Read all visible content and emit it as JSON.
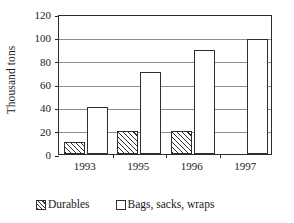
{
  "chart_data": {
    "type": "bar",
    "title": "",
    "xlabel": "",
    "ylabel": "Thousand tons",
    "categories": [
      "1993",
      "1995",
      "1996",
      "1997"
    ],
    "series": [
      {
        "name": "Durables",
        "values": [
          10,
          20,
          20,
          null
        ],
        "fill": "hatched"
      },
      {
        "name": "Bags, sacks, wraps",
        "values": [
          40,
          70,
          89,
          99
        ],
        "fill": "white"
      }
    ],
    "ylim": [
      0,
      120
    ],
    "yticks": [
      0,
      20,
      40,
      60,
      80,
      100,
      120
    ],
    "ytick_labels": [
      "0",
      "20",
      "40",
      "60",
      "80",
      "100",
      "120"
    ],
    "grid": true,
    "grid_axis": "y",
    "legend_position": "bottom",
    "colors": {
      "axis": "#2b2b2b",
      "grid": "#8d8d8d",
      "bar_edge": "#2e2e2e",
      "bar_fill": "#ffffff",
      "text": "#1a1a1a"
    }
  }
}
